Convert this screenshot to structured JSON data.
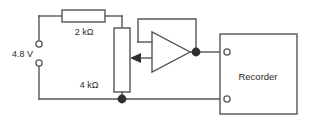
{
  "diagram": {
    "type": "schematic",
    "background_color": "#ffffff",
    "line_color": "#555555",
    "text_color": "#2b2b2b",
    "node_color": "#303030"
  },
  "source": {
    "label": "4.8 V",
    "terminal_top_name": "positive-terminal",
    "terminal_bottom_name": "negative-terminal"
  },
  "resistors": {
    "series": {
      "label": "2 kΩ",
      "value": 2,
      "unit": "kΩ",
      "orientation": "horizontal"
    },
    "potentiometer": {
      "label": "4 kΩ",
      "value": 4,
      "unit": "kΩ",
      "orientation": "vertical",
      "wiper": "arrow-left"
    }
  },
  "amplifier": {
    "name": "op-amp",
    "symbol": "triangle",
    "configuration": "voltage follower",
    "inputs": 2,
    "feedback": "output-to-inverting-input"
  },
  "recorder": {
    "label": "Recorder",
    "terminals": [
      {
        "name": "recorder-input-terminal",
        "position": "top-left"
      },
      {
        "name": "recorder-return-terminal",
        "position": "bottom-left"
      }
    ]
  },
  "nodes": [
    {
      "name": "wiper-output-node"
    },
    {
      "name": "ground-node"
    }
  ]
}
